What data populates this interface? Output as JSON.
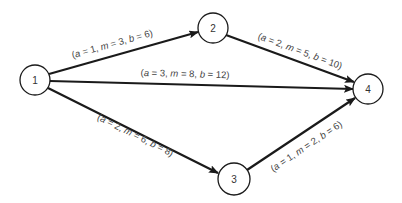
{
  "diagram": {
    "type": "activity-network",
    "colors": {
      "line": "#1a1a1a",
      "node_fill": "#ffffff",
      "text": "#444444"
    },
    "nodes": [
      {
        "id": "1",
        "label": "1",
        "cx": 35,
        "cy": 80,
        "r": 15
      },
      {
        "id": "2",
        "label": "2",
        "cx": 213,
        "cy": 28,
        "r": 15
      },
      {
        "id": "3",
        "label": "3",
        "cx": 234,
        "cy": 179,
        "r": 16
      },
      {
        "id": "4",
        "label": "4",
        "cx": 368,
        "cy": 89,
        "r": 15
      }
    ],
    "edges": [
      {
        "from": "1",
        "to": "2",
        "label": "(a = 1, m = 3, b = 6)",
        "a": "1",
        "m": "3",
        "b": "6"
      },
      {
        "from": "1",
        "to": "4",
        "label": "(a = 3, m = 8, b = 12)",
        "a": "3",
        "m": "8",
        "b": "12"
      },
      {
        "from": "1",
        "to": "3",
        "label": "(a = 2, m = 6, b = 8)",
        "a": "2",
        "m": "6",
        "b": "8"
      },
      {
        "from": "2",
        "to": "4",
        "label": "(a = 2, m = 5, b = 10)",
        "a": "2",
        "m": "5",
        "b": "10"
      },
      {
        "from": "3",
        "to": "4",
        "label": "(a = 1, m = 2, b = 6)",
        "a": "1",
        "m": "2",
        "b": "6"
      }
    ]
  }
}
